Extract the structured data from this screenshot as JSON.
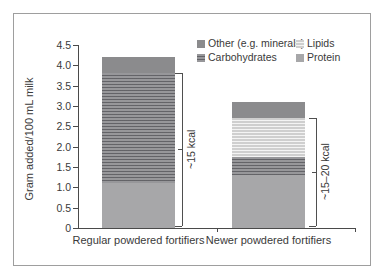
{
  "figure": {
    "background": "#ffffff",
    "frame_border_color": "#9e9e9e",
    "text_color": "#3a3a3a",
    "axis_color": "#4a4a4a"
  },
  "chart_data": {
    "type": "bar",
    "stacked": true,
    "title": "",
    "ylabel": "Gram added/100 mL milk",
    "xlabel": "",
    "ylim": [
      0,
      4.5
    ],
    "yticks": [
      "0",
      "0.5",
      "1.0",
      "1.5",
      "2.0",
      "2.5",
      "3.0",
      "3.5",
      "4.0",
      "4.5"
    ],
    "grid": false,
    "categories": [
      "Regular powdered fortifiers",
      "Newer powdered fortifiers"
    ],
    "series": [
      {
        "key": "protein",
        "name": "Protein",
        "values": [
          1.1,
          1.3
        ],
        "color": "#a7a7a9",
        "texture": "none"
      },
      {
        "key": "carbohydrates",
        "name": "Carbohydrates",
        "values": [
          2.7,
          0.45
        ],
        "color": "#97979a",
        "texture": "dark-lines"
      },
      {
        "key": "lipids",
        "name": "Lipids",
        "values": [
          0,
          0.95
        ],
        "color": "#cfcfcf",
        "texture": "light-lines"
      },
      {
        "key": "other",
        "name": "Other (e.g. minerals)",
        "values": [
          0.4,
          0.4
        ],
        "color": "#8b8b8d",
        "texture": "none"
      }
    ],
    "legend": {
      "position": "top-right",
      "items": [
        {
          "series": "other",
          "label": "Other (e.g. minerals)"
        },
        {
          "series": "lipids",
          "label": "Lipids"
        },
        {
          "series": "carbohydrates",
          "label": "Carbohydrates"
        },
        {
          "series": "protein",
          "label": "Protein"
        }
      ]
    },
    "annotations": [
      {
        "bar": 0,
        "label": "~15 kcal",
        "from": 0.05,
        "to": 3.82
      },
      {
        "bar": 1,
        "label": "~15–20 kcal",
        "from": 0.05,
        "to": 2.7
      }
    ]
  }
}
